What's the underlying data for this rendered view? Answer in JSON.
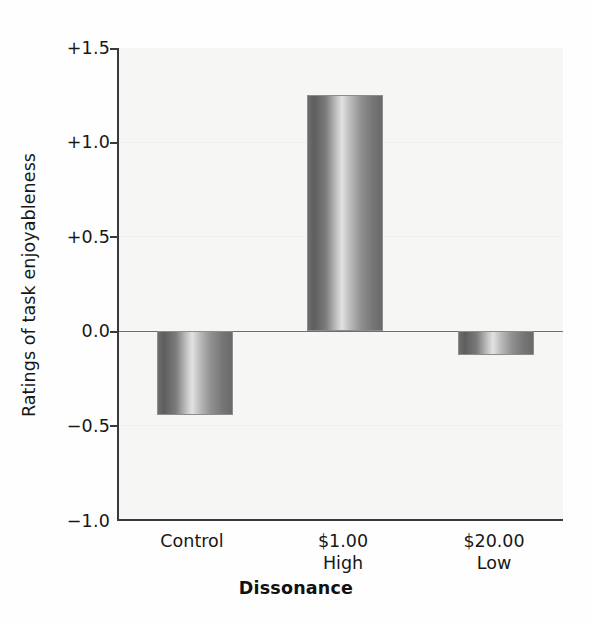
{
  "chart_data": {
    "type": "bar",
    "title": "",
    "subtitle": "",
    "xlabel": "Dissonance",
    "ylabel": "Ratings of task enjoyableness",
    "categories": [
      "Control",
      "$1.00 High",
      "$20.00 Low"
    ],
    "category_lines": [
      {
        "line1": "Control",
        "line2": ""
      },
      {
        "line1": "$1.00",
        "line2": "High"
      },
      {
        "line1": "$20.00",
        "line2": "Low"
      }
    ],
    "values": [
      -0.45,
      1.25,
      -0.13
    ],
    "ylim": [
      -1.0,
      1.5
    ],
    "yticks": [
      1.5,
      1.0,
      0.5,
      0.0,
      -0.5,
      -1.0
    ],
    "ytick_labels": [
      "+1.5",
      "+1.0",
      "+0.5",
      "0.0",
      "−0.5",
      "−1.0"
    ],
    "grid": false,
    "legend": "none",
    "zero_line": 0.0,
    "bar_style": "vertical-gradient-cylinder",
    "colors": {
      "bar_dark": "#6d6d6d",
      "bar_light": "#e2e2e2",
      "axis": "#3a3a3a",
      "plot_background": "#f6f6f4",
      "text": "#171717"
    }
  }
}
